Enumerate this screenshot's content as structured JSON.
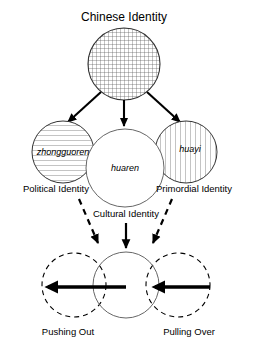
{
  "diagram": {
    "title": "Chinese Identity",
    "colors": {
      "stroke": "#000000",
      "hatch": "#555555",
      "thin_stroke": "#444444",
      "background": "#ffffff"
    },
    "top_node": {
      "name": "chinese-identity",
      "label": "Chinese Identity",
      "fill_pattern": "crosshatch"
    },
    "middle_nodes": [
      {
        "id": "political",
        "inner_label": "zhongguoren",
        "caption": "Political Identity",
        "fill_pattern": "horizontal-lines"
      },
      {
        "id": "cultural",
        "inner_label": "huaren",
        "caption": "Cultural Identity",
        "fill_pattern": "none"
      },
      {
        "id": "primordial",
        "inner_label": "huayi",
        "caption": "Primordial Identity",
        "fill_pattern": "vertical-lines"
      }
    ],
    "bottom_nodes": [
      {
        "id": "pushing-out",
        "caption": "Pushing Out",
        "stroke_style": "dashed"
      },
      {
        "id": "bottom-center",
        "caption": "",
        "stroke_style": "solid"
      },
      {
        "id": "pulling-over",
        "caption": "Pulling Over",
        "stroke_style": "dashed"
      }
    ],
    "connectors": [
      {
        "id": "top-to-political",
        "style": "solid",
        "direction": "down-left"
      },
      {
        "id": "top-to-cultural",
        "style": "solid",
        "direction": "down"
      },
      {
        "id": "top-to-primordial",
        "style": "solid",
        "direction": "down-right"
      },
      {
        "id": "political-to-pushing-out",
        "style": "dashed",
        "direction": "down-left"
      },
      {
        "id": "cultural-to-bottom-center",
        "style": "solid",
        "direction": "down"
      },
      {
        "id": "primordial-to-pulling-over",
        "style": "dashed",
        "direction": "down-right"
      },
      {
        "id": "pushing-out-arrow",
        "style": "thick-solid",
        "direction": "left"
      },
      {
        "id": "pulling-over-arrow",
        "style": "thick-solid",
        "direction": "left"
      }
    ]
  }
}
